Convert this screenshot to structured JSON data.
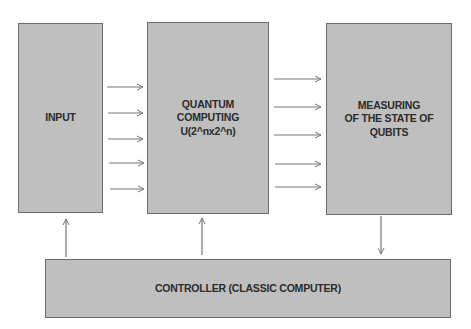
{
  "diagram": {
    "title": "",
    "colors": {
      "box_fill": "#bfbfbf",
      "box_border": "#6b6b6b",
      "text": "#2b2b2b",
      "arrow": "#777777",
      "background": "#ffffff"
    },
    "nodes": [
      {
        "id": "input",
        "label": "INPUT"
      },
      {
        "id": "quantum",
        "label": "QUANTUM\nCOMPUTING\nU(2^nx2^n)"
      },
      {
        "id": "measuring",
        "label": "MEASURING\nOF THE STATE OF\nQUBITS"
      },
      {
        "id": "controller",
        "label": "CONTROLLER (CLASSIC COMPUTER)"
      }
    ],
    "edges": [
      {
        "from": "input",
        "to": "quantum",
        "count": 5,
        "direction": "right"
      },
      {
        "from": "quantum",
        "to": "measuring",
        "count": 5,
        "direction": "right"
      },
      {
        "from": "controller",
        "to": "input",
        "count": 1,
        "direction": "up"
      },
      {
        "from": "controller",
        "to": "quantum",
        "count": 1,
        "direction": "up"
      },
      {
        "from": "measuring",
        "to": "controller",
        "count": 1,
        "direction": "down"
      }
    ]
  }
}
